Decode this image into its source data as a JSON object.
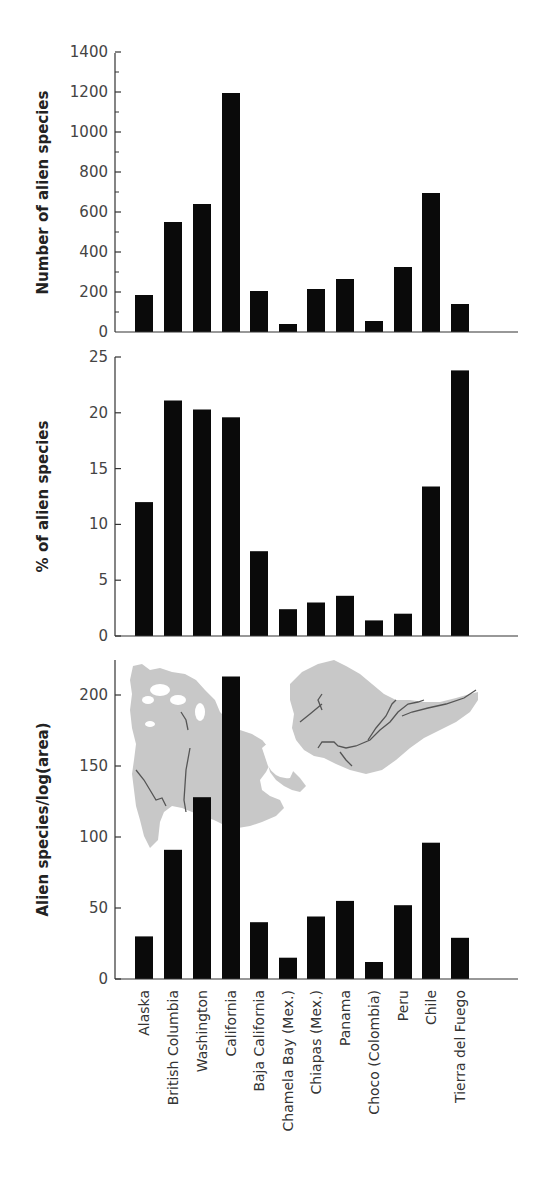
{
  "chart_data": [
    {
      "type": "bar",
      "title": "",
      "xlabel": "",
      "ylabel": "Number of alien species",
      "ylim": [
        0,
        1400
      ],
      "yticks": [
        0,
        200,
        400,
        600,
        800,
        1000,
        1200,
        1400
      ],
      "minor_ticks": true,
      "grid": false,
      "categories": [
        "Alaska",
        "British Columbia",
        "Washington",
        "California",
        "Baja California",
        "Chamela Bay (Mex.)",
        "Chiapas (Mex.)",
        "Panama",
        "Choco (Colombia)",
        "Peru",
        "Chile",
        "Tierra del Fuego"
      ],
      "values": [
        185,
        550,
        640,
        1195,
        205,
        40,
        215,
        265,
        55,
        325,
        695,
        140
      ]
    },
    {
      "type": "bar",
      "title": "",
      "xlabel": "",
      "ylabel": "% of alien species",
      "ylim": [
        0,
        25
      ],
      "yticks": [
        0,
        5,
        10,
        15,
        20,
        25
      ],
      "grid": false,
      "categories": [
        "Alaska",
        "British Columbia",
        "Washington",
        "California",
        "Baja California",
        "Chamela Bay (Mex.)",
        "Chiapas (Mex.)",
        "Panama",
        "Choco (Colombia)",
        "Peru",
        "Chile",
        "Tierra del Fuego"
      ],
      "values": [
        12.0,
        21.1,
        20.3,
        19.6,
        7.6,
        2.4,
        3.0,
        3.6,
        1.4,
        2.0,
        13.4,
        23.8
      ]
    },
    {
      "type": "bar",
      "title": "",
      "xlabel": "",
      "ylabel": "Alien species/log(area)",
      "ylim": [
        0,
        225
      ],
      "yticks": [
        0,
        50,
        100,
        150,
        200
      ],
      "grid": false,
      "annotation": "Background inset map of the Americas (gray silhouette with rivers)",
      "categories": [
        "Alaska",
        "British Columbia",
        "Washington",
        "California",
        "Baja California",
        "Chamela Bay (Mex.)",
        "Chiapas (Mex.)",
        "Panama",
        "Choco (Colombia)",
        "Peru",
        "Chile",
        "Tierra del Fuego"
      ],
      "values": [
        30,
        91,
        128,
        213,
        40,
        15,
        44,
        55,
        12,
        52,
        96,
        29
      ]
    }
  ],
  "labels": {
    "y1": "Number of alien species",
    "y2": "% of alien species",
    "y3": "Alien species/log(area)",
    "categories": [
      "Alaska",
      "British Columbia",
      "Washington",
      "California",
      "Baja California",
      "Chamela Bay (Mex.)",
      "Chiapas (Mex.)",
      "Panama",
      "Choco (Colombia)",
      "Peru",
      "Chile",
      "Tierra del Fuego"
    ]
  },
  "style": {
    "bar_color": "#0a0a0a",
    "axis_color": "#333333",
    "map_color": "#c8c8c8",
    "river_color": "#555555"
  }
}
